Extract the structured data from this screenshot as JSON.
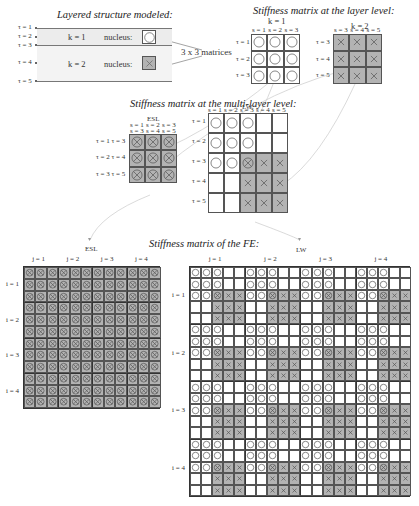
{
  "titles": {
    "layered": "Layered structure modeled:",
    "layer_level": "Stiffness matrix at the layer level:",
    "multi_layer": "Stiffness matrix at the multi-layer level:",
    "fe": "Stiffness matrix of the FE:"
  },
  "layered_structure": {
    "interfaces": [
      "τ = 1",
      "τ = 2",
      "τ = 3",
      "τ = 4",
      "τ = 5"
    ],
    "layers": [
      {
        "label": "k = 1",
        "nucleus_label": "nucleus:",
        "nucleus_symbol": "circle"
      },
      {
        "label": "k = 2",
        "nucleus_label": "nucleus:",
        "nucleus_symbol": "cross"
      }
    ],
    "matrix_note": "3 x 3 matrices"
  },
  "layer_level": {
    "k1": {
      "label": "k = 1",
      "cols": [
        "s = 1",
        "s = 2",
        "s = 3"
      ],
      "rows": [
        "τ = 1",
        "τ = 2",
        "τ = 3"
      ],
      "symbol": "circle"
    },
    "k2": {
      "label": "k = 2",
      "cols": [
        "s = 3",
        "s = 4",
        "s = 5"
      ],
      "rows": [
        "τ = 3",
        "τ = 4",
        "τ = 5"
      ],
      "symbol": "cross"
    }
  },
  "multi_layer": {
    "esl": {
      "label": "ESL",
      "cols_top": [
        "s = 1",
        "s = 2",
        "s = 3"
      ],
      "cols_bottom": [
        "s = 3",
        "s = 4",
        "s = 5"
      ],
      "rows": [
        "τ = 1  τ = 3",
        "τ = 2  τ = 4",
        "τ = 3  τ = 5"
      ]
    },
    "lw": {
      "label": "LW",
      "cols": [
        "s = 1",
        "s = 2",
        "s = 3",
        "s = 4",
        "s = 5"
      ],
      "rows": [
        "τ = 1",
        "τ = 2",
        "τ = 3",
        "τ = 4",
        "τ = 5"
      ],
      "pattern": [
        [
          "o",
          "o",
          "o",
          "",
          ""
        ],
        [
          "o",
          "o",
          "o",
          "",
          ""
        ],
        [
          "o",
          "o",
          "ox",
          "x",
          "x"
        ],
        [
          "",
          "",
          "x",
          "x",
          "x"
        ],
        [
          "",
          "",
          "x",
          "x",
          "x"
        ]
      ]
    }
  },
  "fe": {
    "esl": {
      "label": "ESL",
      "cols": [
        "j = 1",
        "j = 2",
        "j = 3",
        "j = 4"
      ],
      "rows": [
        "i = 1",
        "i = 2",
        "i = 3",
        "i = 4"
      ],
      "block_size": 3
    },
    "lw": {
      "label": "LW",
      "cols": [
        "j = 1",
        "j = 2",
        "j = 3",
        "j = 4"
      ],
      "rows": [
        "i = 1",
        "i = 2",
        "i = 3",
        "i = 4"
      ],
      "block_size": 5
    }
  },
  "colors": {
    "gray_cell": "#b3b3b3",
    "band": "#ececec",
    "line": "#555555",
    "connector": "#cfcfcf"
  }
}
